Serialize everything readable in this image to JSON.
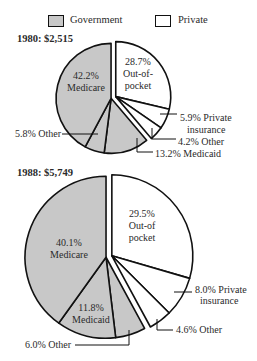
{
  "legend": {
    "items": [
      {
        "label": "Government",
        "color": "#c8c8c8"
      },
      {
        "label": "Private",
        "color": "#ffffff"
      }
    ]
  },
  "chart_data": [
    {
      "type": "pie",
      "title": "1980: $2,515",
      "year": "1980",
      "total": "$2,515",
      "slices": [
        {
          "label": "Out-of-pocket",
          "value": 28.7,
          "group": "Private"
        },
        {
          "label": "Private insurance",
          "value": 5.9,
          "group": "Private"
        },
        {
          "label": "Other",
          "value": 4.2,
          "group": "Private"
        },
        {
          "label": "Medicaid",
          "value": 13.2,
          "group": "Government"
        },
        {
          "label": "Other",
          "value": 5.8,
          "group": "Government"
        },
        {
          "label": "Medicare",
          "value": 42.2,
          "group": "Government"
        }
      ],
      "labels": {
        "out_of_pocket": [
          "28.7%",
          "Out-of-",
          "pocket"
        ],
        "medicare": [
          "42.2%",
          "Medicare"
        ],
        "private_insurance": [
          "5.9% Private",
          "insurance"
        ],
        "other_private": "4.2% Other",
        "medicaid": "13.2% Medicaid",
        "other_gov": "5.8% Other"
      }
    },
    {
      "type": "pie",
      "title": "1988: $5,749",
      "year": "1988",
      "total": "$5,749",
      "slices": [
        {
          "label": "Out-of-pocket",
          "value": 29.5,
          "group": "Private"
        },
        {
          "label": "Private insurance",
          "value": 8.0,
          "group": "Private"
        },
        {
          "label": "Other",
          "value": 4.6,
          "group": "Private"
        },
        {
          "label": "Other",
          "value": 6.0,
          "group": "Government"
        },
        {
          "label": "Medicaid",
          "value": 11.8,
          "group": "Government"
        },
        {
          "label": "Medicare",
          "value": 40.1,
          "group": "Government"
        }
      ],
      "labels": {
        "out_of_pocket": [
          "29.5%",
          "Out-of",
          "pocket"
        ],
        "medicare": [
          "40.1%",
          "Medicare"
        ],
        "medicaid": [
          "11.8%",
          "Medicaid"
        ],
        "private_insurance": [
          "8.0% Private",
          "insurance"
        ],
        "other_private": "4.6% Other",
        "other_gov": "6.0% Other"
      }
    }
  ]
}
